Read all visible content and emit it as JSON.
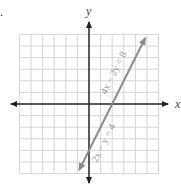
{
  "problem_marker": ".",
  "chart_data": {
    "type": "line",
    "title": "",
    "xlabel": "x",
    "ylabel": "y",
    "xlim": [
      -6,
      6
    ],
    "ylim": [
      -6,
      6
    ],
    "grid": true,
    "tick_labels_shown": false,
    "series": [
      {
        "name": "2x − y = 4 (also 4x − 2y = 8)",
        "equation_labels": [
          "4x − 2y = 8",
          "2x − y = 4"
        ],
        "slope": 2,
        "intercept": -4,
        "points": [
          [
            -0.85,
            -5.7
          ],
          [
            0,
            -4
          ],
          [
            2,
            0
          ],
          [
            4,
            4
          ],
          [
            4.85,
            5.7
          ]
        ],
        "arrows": "both",
        "color": "#8a8a8a"
      }
    ],
    "axes": {
      "color": "#222222",
      "arrows": "both"
    },
    "grid_color": "#d4d4d4"
  },
  "labels": {
    "x_axis": "x",
    "y_axis": "y",
    "eq_upper": "4x − 2y = 8",
    "eq_lower": "2x − y = 4"
  }
}
